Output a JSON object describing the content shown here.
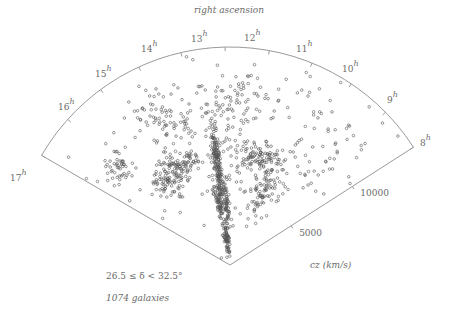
{
  "title": "right ascension",
  "geometry": {
    "apex": [
      230,
      265
    ],
    "radius": 218,
    "left_corner_angle_deg": 210.2,
    "right_corner_angle_deg": 327.3,
    "line_color": "#9a9a9a",
    "point_color": "#555555"
  },
  "hour_labels": [
    {
      "hour": "17",
      "x": 10,
      "y": 170
    },
    {
      "hour": "16",
      "x": 58,
      "y": 99
    },
    {
      "hour": "15",
      "x": 95,
      "y": 66
    },
    {
      "hour": "14",
      "x": 141,
      "y": 41
    },
    {
      "hour": "13",
      "x": 191,
      "y": 31
    },
    {
      "hour": "12",
      "x": 244,
      "y": 30
    },
    {
      "hour": "11",
      "x": 296,
      "y": 41
    },
    {
      "hour": "10",
      "x": 342,
      "y": 61
    },
    {
      "hour": "9",
      "x": 387,
      "y": 92
    },
    {
      "hour": "8",
      "x": 420,
      "y": 135
    }
  ],
  "hour_tick_angles_deg": [
    210.2,
    221.9,
    233.6,
    245.3,
    257.0,
    268.7,
    280.4,
    292.1,
    303.8,
    315.5,
    327.3
  ],
  "distance_ticks": [
    {
      "label": "5000",
      "cz": 5000
    },
    {
      "label": "10000",
      "cz": 10000
    }
  ],
  "cz_max": 15000,
  "axis_label_cz": "cz  (km/s)",
  "declination_label": "26.5  ≤  δ  <    32.5°",
  "count_label": "1074  galaxies",
  "chart_data": {
    "type": "scatter",
    "subtype": "redshift wedge diagram (polar)",
    "title": "right ascension",
    "angular_axis": {
      "label": "right ascension",
      "ticks": [
        "17h",
        "16h",
        "15h",
        "14h",
        "13h",
        "12h",
        "11h",
        "10h",
        "9h",
        "8h"
      ]
    },
    "radial_axis": {
      "label": "cz (km/s)",
      "ticks": [
        5000,
        10000
      ],
      "range": [
        0,
        15000
      ]
    },
    "annotations": [
      "26.5 ≤ δ < 32.5°",
      "1074 galaxies"
    ],
    "n_points": 1074,
    "clusters": [
      {
        "name": "Coma finger",
        "ra_h": 12.95,
        "cz": 7000,
        "spread_ra": 0.08,
        "spread_cz": 1300,
        "n": 170
      },
      {
        "name": "Great Wall left arm",
        "ra_h": 14.6,
        "cz": 7600,
        "spread_ra": 0.55,
        "spread_cz": 450,
        "n": 120
      },
      {
        "name": "Great Wall right arm",
        "ra_h": 11.2,
        "cz": 7800,
        "spread_ra": 0.6,
        "spread_cz": 500,
        "n": 110
      },
      {
        "name": "Stickman legs left",
        "ra_h": 13.2,
        "cz": 4300,
        "spread_ra": 0.12,
        "spread_cz": 900,
        "n": 60
      },
      {
        "name": "Stickman legs right",
        "ra_h": 12.65,
        "cz": 4300,
        "spread_ra": 0.1,
        "spread_cz": 900,
        "n": 55
      },
      {
        "name": "Near foreground",
        "ra_h": 12.9,
        "cz": 2000,
        "spread_ra": 0.25,
        "spread_cz": 700,
        "n": 70
      },
      {
        "name": "Hercules wall",
        "ra_h": 16.2,
        "cz": 10200,
        "spread_ra": 0.25,
        "spread_cz": 500,
        "n": 45
      },
      {
        "name": "Lower left wall",
        "ra_h": 15.3,
        "cz": 6800,
        "spread_ra": 0.5,
        "spread_cz": 500,
        "n": 40
      },
      {
        "name": "Upper left",
        "ra_h": 14.3,
        "cz": 11000,
        "spread_ra": 0.5,
        "spread_cz": 1000,
        "n": 80
      },
      {
        "name": "Upper center",
        "ra_h": 12.3,
        "cz": 11500,
        "spread_ra": 0.5,
        "spread_cz": 900,
        "n": 70
      },
      {
        "name": "Right mid",
        "ra_h": 10.6,
        "cz": 5600,
        "spread_ra": 0.4,
        "spread_cz": 900,
        "n": 80
      },
      {
        "name": "Right field",
        "ra_h": 9.4,
        "cz": 10500,
        "spread_ra": 0.7,
        "spread_cz": 2200,
        "n": 45
      },
      {
        "name": "Field",
        "ra_h": 12.5,
        "cz": 9000,
        "spread_ra": 2.6,
        "spread_cz": 3500,
        "n": 139
      }
    ]
  }
}
